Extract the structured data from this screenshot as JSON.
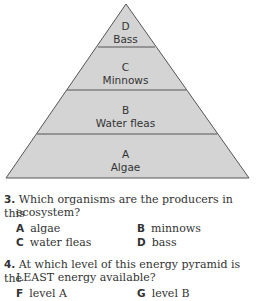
{
  "pyramid": {
    "fill": "#d4d4d4",
    "stroke": "#555555",
    "levels": [
      {
        "letter": "D",
        "name": "Bass"
      },
      {
        "letter": "C",
        "name": "Minnows"
      },
      {
        "letter": "B",
        "name": "Water fleas"
      },
      {
        "letter": "A",
        "name": "Algae"
      }
    ]
  },
  "questions": [
    {
      "number": "3.",
      "text_line1": "Which organisms are the producers in this",
      "text_line2": "ecosystem?",
      "options": [
        {
          "letter": "A",
          "text": "algae"
        },
        {
          "letter": "B",
          "text": "minnows"
        },
        {
          "letter": "C",
          "text": "water fleas"
        },
        {
          "letter": "D",
          "text": "bass"
        }
      ]
    },
    {
      "number": "4.",
      "text_line1": "At which level of this energy pyramid is the",
      "text_line2": "LEAST energy available?",
      "options": [
        {
          "letter": "F",
          "text": "level A"
        },
        {
          "letter": "G",
          "text": "level B"
        }
      ]
    }
  ]
}
